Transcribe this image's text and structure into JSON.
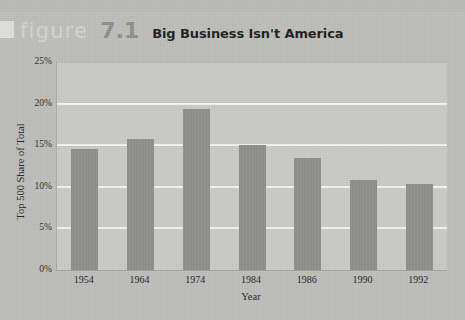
{
  "header": {
    "figure_word": "figure",
    "figure_number": "7.1",
    "title": "Big Business Isn't America"
  },
  "colors": {
    "page_background": "#bdbdbb",
    "plot_background": "#c9c9c7",
    "bar": "#8d8d8b",
    "gridline": "#f2f2f0",
    "figure_word": "#d2d2d0",
    "figure_number": "#8e8e8c",
    "title": "#1d1d1b",
    "axis_text": "#1f1f1d"
  },
  "chart_data": {
    "type": "bar",
    "title": "Big Business Isn't America",
    "categories": [
      "1954",
      "1964",
      "1974",
      "1984",
      "1986",
      "1990",
      "1992"
    ],
    "values": [
      14.5,
      15.8,
      19.4,
      15.0,
      13.5,
      10.8,
      10.3
    ],
    "xlabel": "Year",
    "ylabel": "Top 500 Share of Total",
    "ylim": [
      0,
      25
    ],
    "ytick_labels": [
      "0%",
      "5%",
      "10%",
      "15%",
      "20%",
      "25%"
    ],
    "ytick_values": [
      0,
      5,
      10,
      15,
      20,
      25
    ],
    "grid": true,
    "grid_axis": "y",
    "legend": false,
    "legend_position": "none",
    "value_unit": "percent"
  }
}
